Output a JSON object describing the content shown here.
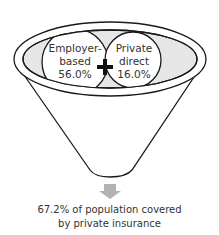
{
  "diagram": {
    "type": "funnel",
    "inputs": [
      {
        "label_line1": "Employer-",
        "label_line2": "based",
        "value": "56.0%"
      },
      {
        "label_line1": "Private",
        "label_line2": "direct",
        "value": "16.0%"
      }
    ],
    "operator": "+",
    "result": {
      "line1": "67.2% of population covered",
      "line2": "by private insurance"
    },
    "colors": {
      "stroke": "#1a1a1a",
      "fill_inner": "#e6e6e6",
      "arrow": "#b3b3b3",
      "text": "#333333"
    }
  }
}
